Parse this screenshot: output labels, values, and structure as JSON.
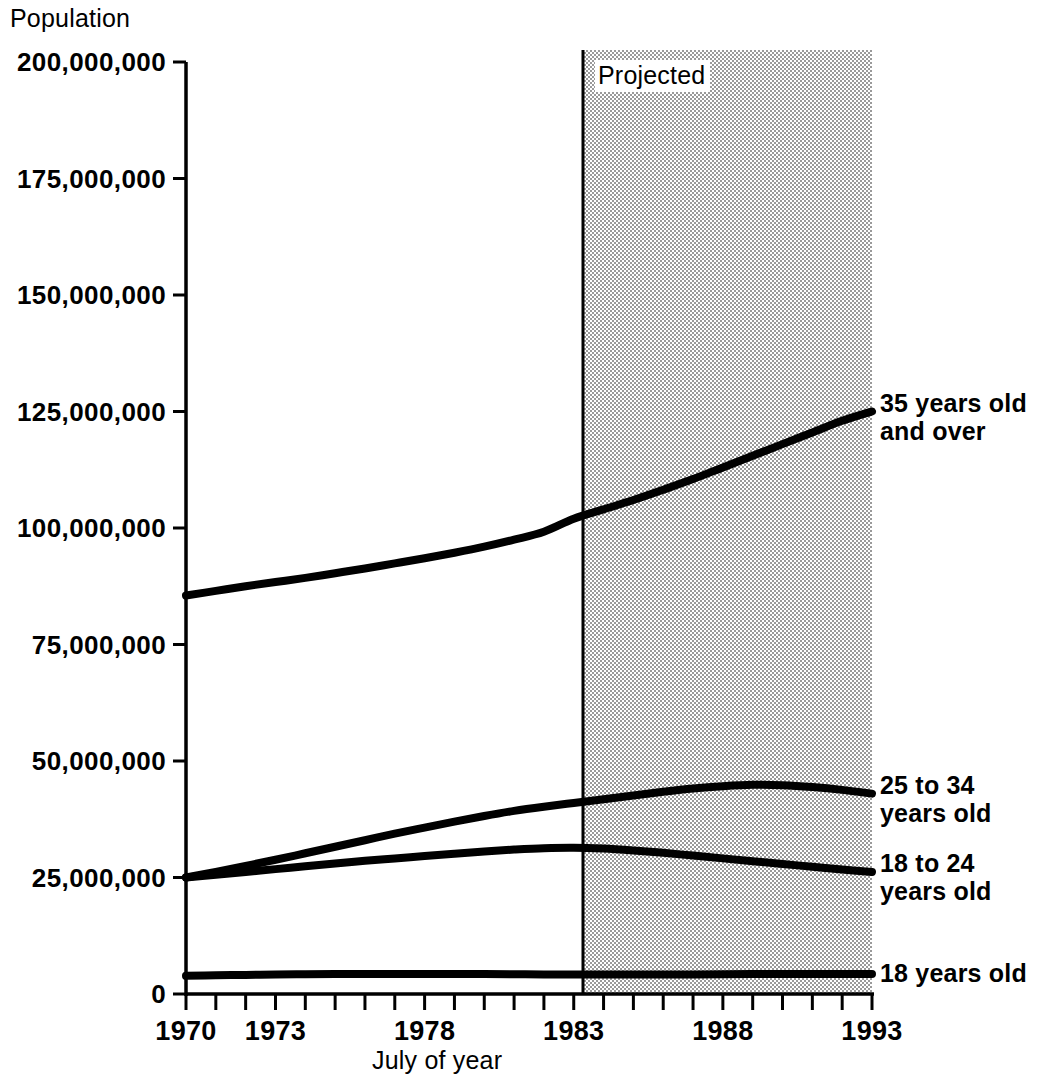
{
  "chart_data": {
    "type": "line",
    "title": "",
    "ylabel": "Population",
    "xlabel": "July of year",
    "xlim": [
      1970,
      1993
    ],
    "ylim": [
      0,
      200000000
    ],
    "grid": false,
    "legend_position": "right-of-plot-inline",
    "annotations": [
      {
        "text": "Projected",
        "x": 1983,
        "note": "shaded band covers 1983 through 1993 indicating projected values"
      }
    ],
    "y_tick_labels": [
      "0",
      "25,000,000",
      "50,000,000",
      "75,000,000",
      "100,000,000",
      "125,000,000",
      "150,000,000",
      "175,000,000",
      "200,000,000"
    ],
    "y_tick_values": [
      0,
      25000000,
      50000000,
      75000000,
      100000000,
      125000000,
      150000000,
      175000000,
      200000000
    ],
    "x_tick_labels": [
      "1970",
      "1973",
      "1978",
      "1983",
      "1988",
      "1993"
    ],
    "x_tick_values": [
      1970,
      1973,
      1978,
      1983,
      1988,
      1993
    ],
    "x_minor_ticks": [
      1970,
      1971,
      1972,
      1973,
      1974,
      1975,
      1976,
      1977,
      1978,
      1979,
      1980,
      1981,
      1982,
      1983,
      1984,
      1985,
      1986,
      1987,
      1988,
      1989,
      1990,
      1991,
      1992,
      1993
    ],
    "projection_start_year": 1983,
    "x": [
      1970,
      1971,
      1972,
      1973,
      1974,
      1975,
      1976,
      1977,
      1978,
      1979,
      1980,
      1981,
      1982,
      1983,
      1984,
      1985,
      1986,
      1987,
      1988,
      1989,
      1990,
      1991,
      1992,
      1993
    ],
    "series": [
      {
        "name": "35 years old and over",
        "label_lines": [
          "35 years old",
          "and over"
        ],
        "color": "#000000",
        "values": [
          85500000,
          86500000,
          87500000,
          88400000,
          89300000,
          90300000,
          91300000,
          92400000,
          93500000,
          94700000,
          96000000,
          97500000,
          99200000,
          102000000,
          104000000,
          106000000,
          108200000,
          110500000,
          113000000,
          115500000,
          118000000,
          120500000,
          123000000,
          125000000
        ]
      },
      {
        "name": "25 to 34 years old",
        "label_lines": [
          "25 to 34",
          "years old"
        ],
        "color": "#000000",
        "values": [
          25000000,
          26200000,
          27500000,
          28800000,
          30200000,
          31600000,
          33000000,
          34400000,
          35700000,
          37000000,
          38200000,
          39300000,
          40200000,
          41000000,
          41800000,
          42600000,
          43400000,
          44100000,
          44600000,
          44900000,
          44800000,
          44400000,
          43800000,
          43000000
        ],
        "label_value_1993": 43000000
      },
      {
        "name": "18 to 24 years old",
        "label_lines": [
          "18 to 24",
          "years old"
        ],
        "color": "#000000",
        "values": [
          25000000,
          25600000,
          26200000,
          26800000,
          27400000,
          28000000,
          28600000,
          29100000,
          29600000,
          30100000,
          30600000,
          31000000,
          31300000,
          31400000,
          31200000,
          30800000,
          30300000,
          29700000,
          29100000,
          28500000,
          27900000,
          27300000,
          26700000,
          26200000
        ],
        "label_value_1993": 26200000
      },
      {
        "name": "18 years old",
        "label_lines": [
          "18 years old"
        ],
        "color": "#000000",
        "values": [
          3900000,
          4000000,
          4100000,
          4200000,
          4250000,
          4300000,
          4300000,
          4300000,
          4300000,
          4300000,
          4300000,
          4250000,
          4200000,
          4200000,
          4200000,
          4200000,
          4200000,
          4200000,
          4250000,
          4300000,
          4300000,
          4300000,
          4300000,
          4300000
        ]
      }
    ]
  },
  "colors": {
    "line": "#000000",
    "axis": "#000000",
    "projected_shade": "#c9c9c9",
    "background": "#ffffff"
  }
}
